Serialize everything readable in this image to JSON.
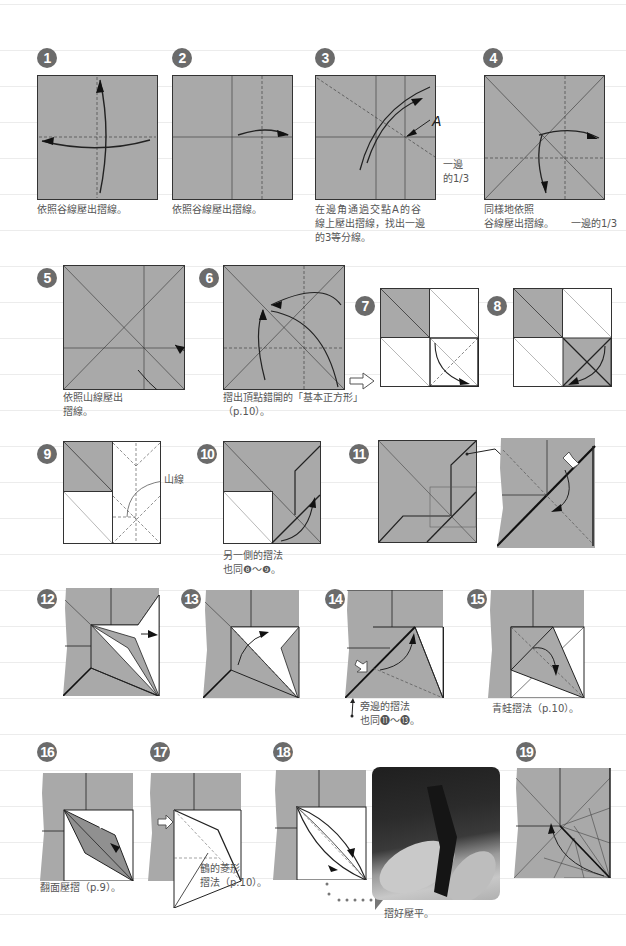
{
  "page": {
    "colors": {
      "paper_gray": "#a9a9a9",
      "white_side": "#ffffff",
      "line": "#333333",
      "badge": "#6b6b6b",
      "caption": "#555555"
    }
  },
  "steps": [
    {
      "num": "1",
      "caption": [
        "依照谷線壓出摺線。"
      ]
    },
    {
      "num": "2",
      "caption": [
        "依照谷線壓出摺線。"
      ]
    },
    {
      "num": "3",
      "caption": [
        "在邊角通過交點A的谷",
        "線上壓出摺線，找出一邊",
        "的3等分線。"
      ],
      "label_A": "A",
      "side_note": [
        "一邊",
        "的1/3"
      ]
    },
    {
      "num": "4",
      "caption": [
        "同樣地依照",
        "谷線壓出摺線。"
      ],
      "side_note": "一邊的1/3"
    },
    {
      "num": "5",
      "caption": [
        "依照山線壓出",
        "摺線。"
      ]
    },
    {
      "num": "6",
      "caption": [
        "摺出頂點錯開的「基本正方形」",
        "（p.10）。"
      ]
    },
    {
      "num": "7",
      "caption": []
    },
    {
      "num": "8",
      "caption": []
    },
    {
      "num": "9",
      "caption": [],
      "label": "山線"
    },
    {
      "num": "10",
      "caption": [
        "另一側的摺法",
        "也同❽～❾。"
      ]
    },
    {
      "num": "11",
      "caption": []
    },
    {
      "num": "12",
      "caption": []
    },
    {
      "num": "13",
      "caption": []
    },
    {
      "num": "14",
      "caption": [
        "旁邊的摺法",
        "也同⓫～⓭。"
      ]
    },
    {
      "num": "15",
      "caption": [
        "青蛙摺法（p.10）。"
      ]
    },
    {
      "num": "16",
      "caption": [
        "翻面壓摺（p.9）。"
      ]
    },
    {
      "num": "17",
      "caption": [
        "鶴的菱形",
        "摺法（p.10）。"
      ]
    },
    {
      "num": "18",
      "caption": [
        "摺好壓平。"
      ]
    },
    {
      "num": "19",
      "caption": []
    }
  ]
}
